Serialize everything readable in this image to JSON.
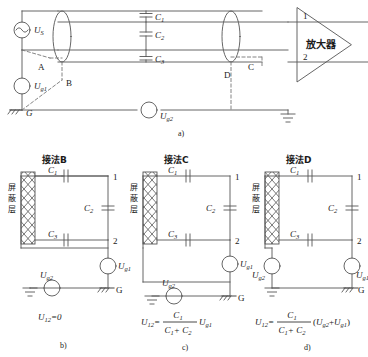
{
  "figure": {
    "caption_a": "a)",
    "caption_b": "b)",
    "caption_c": "c)",
    "caption_d": "d)"
  },
  "top_diagram": {
    "source_label": "U",
    "source_sub": "S",
    "ground_source_label": "U",
    "ground_source_sub": "g1",
    "ground_source2_label": "U",
    "ground_source2_sub": "g2",
    "ground_label": "G",
    "amplifier_label": "放大器",
    "terminal_1": "1",
    "terminal_2": "2",
    "capacitors": [
      {
        "label": "C",
        "sub": "1"
      },
      {
        "label": "C",
        "sub": "2"
      },
      {
        "label": "C",
        "sub": "3"
      }
    ],
    "nodes": [
      {
        "name": "A",
        "label": "A"
      },
      {
        "name": "B",
        "label": "B"
      },
      {
        "name": "C",
        "label": "C"
      },
      {
        "name": "D",
        "label": "D"
      }
    ]
  },
  "circuits": [
    {
      "id": "b",
      "title": "接法B",
      "shield_label": "屏蔽层",
      "shield_chars": [
        "屏",
        "蔽",
        "层"
      ],
      "capacitors": [
        {
          "label": "C",
          "sub": "1"
        },
        {
          "label": "C",
          "sub": "2"
        },
        {
          "label": "C",
          "sub": "3"
        }
      ],
      "terminal_1": "1",
      "terminal_2": "2",
      "source_g1": {
        "label": "U",
        "sub": "g1"
      },
      "source_g2": {
        "label": "U",
        "sub": "g2"
      },
      "ground_label": "G",
      "formula": {
        "lhs": "U",
        "lhs_sub": "12",
        "eq": "=",
        "rhs_plain": "0"
      },
      "caption": "b)"
    },
    {
      "id": "c",
      "title": "接法C",
      "shield_label": "屏蔽层",
      "shield_chars": [
        "屏",
        "蔽",
        "层"
      ],
      "capacitors": [
        {
          "label": "C",
          "sub": "1"
        },
        {
          "label": "C",
          "sub": "2"
        },
        {
          "label": "C",
          "sub": "3"
        }
      ],
      "terminal_1": "1",
      "terminal_2": "2",
      "source_g1": {
        "label": "U",
        "sub": "g1"
      },
      "source_g2": {
        "label": "U",
        "sub": "g2"
      },
      "ground_label": "G",
      "formula": {
        "lhs": "U",
        "lhs_sub": "12",
        "eq": "=",
        "num": "C",
        "num_sub": "1",
        "den": "C",
        "den_sub1": "1",
        "den_plus": "+ C",
        "den_sub2": "2",
        "tail": "U",
        "tail_sub": "g1"
      },
      "caption": "c)"
    },
    {
      "id": "d",
      "title": "接法D",
      "shield_label": "屏蔽层",
      "shield_chars": [
        "屏",
        "蔽",
        "层"
      ],
      "capacitors": [
        {
          "label": "C",
          "sub": "1"
        },
        {
          "label": "C",
          "sub": "2"
        },
        {
          "label": "C",
          "sub": "3"
        }
      ],
      "terminal_1": "1",
      "terminal_2": "2",
      "source_g1": {
        "label": "U",
        "sub": "g1"
      },
      "source_g2": {
        "label": "U",
        "sub": "g2"
      },
      "ground_label": "G",
      "formula": {
        "lhs": "U",
        "lhs_sub": "12",
        "eq": "=",
        "num": "C",
        "num_sub": "1",
        "den": "C",
        "den_sub1": "1",
        "den_plus": "+ C",
        "den_sub2": "2",
        "paren_open": "(",
        "t1": "U",
        "t1_sub": "g2",
        "plus": "+",
        "t2": "U",
        "t2_sub": "g1",
        "paren_close": ")"
      },
      "caption": "d)"
    }
  ],
  "colors": {
    "line": "#555555",
    "text": "#1a1a1a",
    "dashed": "#777777"
  }
}
